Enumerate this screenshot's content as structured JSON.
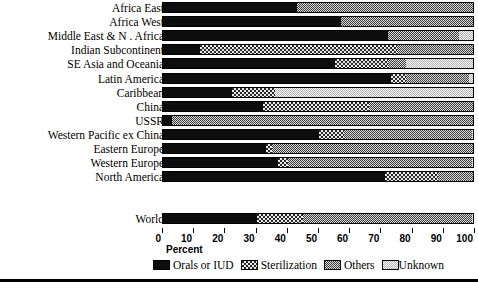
{
  "chart_data": {
    "type": "bar",
    "subtype": "stacked-horizontal-100pct",
    "title": "",
    "xlabel": "Percent",
    "ylabel": "",
    "xlim": [
      0,
      100
    ],
    "xticks": [
      0,
      10,
      20,
      30,
      40,
      50,
      60,
      70,
      80,
      90,
      100
    ],
    "xticklabels": [
      "0",
      "10",
      "20",
      "30",
      "40",
      "50",
      "60",
      "70",
      "80",
      "90",
      "100"
    ],
    "grid": false,
    "legend_position": "bottom",
    "series": [
      {
        "name": "Orals or IUD",
        "pattern": "solid-black",
        "values": [
          43,
          57,
          72,
          12,
          55,
          73,
          22,
          32,
          3,
          50,
          33,
          37,
          71
        ]
      },
      {
        "name": "Sterilization",
        "pattern": "coarse-checkerboard",
        "values": [
          0,
          0,
          0,
          63,
          17,
          5,
          14,
          34,
          0,
          8,
          2,
          3,
          17
        ]
      },
      {
        "name": "Others",
        "pattern": "fine-checkerboard",
        "values": [
          57,
          43,
          23,
          25,
          6,
          20,
          0,
          34,
          97,
          41,
          65,
          59,
          12
        ]
      },
      {
        "name": "Unknown",
        "pattern": "light-stipple",
        "values": [
          0,
          0,
          5,
          0,
          22,
          2,
          64,
          0,
          0,
          1,
          0,
          1,
          0
        ]
      }
    ],
    "categories": [
      "Africa East",
      "Africa West",
      "Middle East & N . Africa",
      "Indian Subcontinent",
      "SE Asia and Oceania",
      "Latin America",
      "Caribbean",
      "China",
      "USSR",
      "Western Pacific ex China",
      "Eastern Europe",
      "Western Europe",
      "North America"
    ],
    "summary_row": {
      "category": "World",
      "values": {
        "Orals or IUD": 30,
        "Sterilization": 15,
        "Others": 54,
        "Unknown": 1
      }
    }
  },
  "legend": {
    "items": [
      {
        "label": "Orals or IUD"
      },
      {
        "label": "Sterilization"
      },
      {
        "label": "Others"
      },
      {
        "label": "Unknown"
      }
    ]
  },
  "colors": {
    "orals_or_iud": "#0d0d0d",
    "sterilization": "#2a2a2a",
    "others": "#3d3d3d",
    "unknown": "#f2f2f2",
    "axis": "#000000",
    "background": "#ffffff"
  }
}
